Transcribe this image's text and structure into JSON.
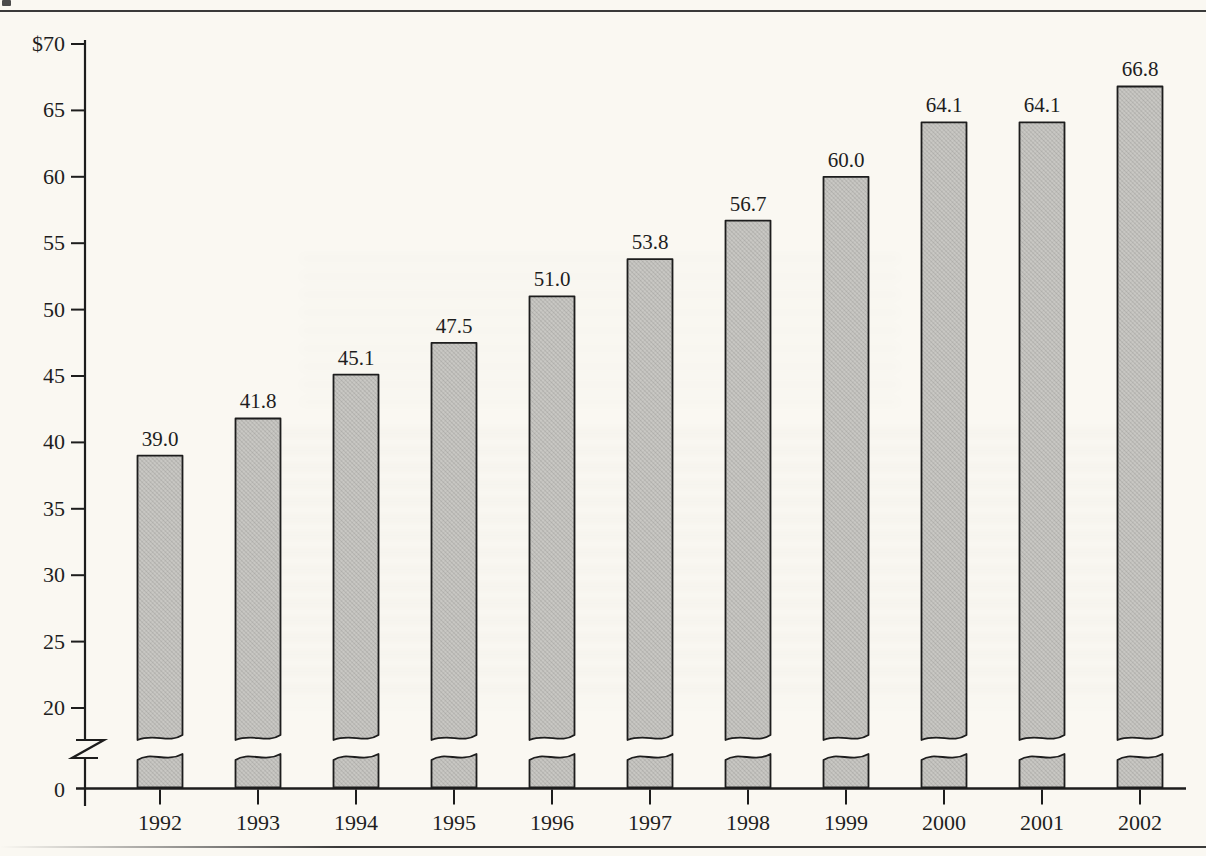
{
  "figure": {
    "kind": "scanned-book-bar-chart",
    "currency_prefix": "$"
  },
  "chart_data": {
    "type": "bar",
    "title": "",
    "xlabel": "",
    "ylabel": "",
    "categories": [
      "1992",
      "1993",
      "1994",
      "1995",
      "1996",
      "1997",
      "1998",
      "1999",
      "2000",
      "2001",
      "2002"
    ],
    "values": [
      39.0,
      41.8,
      45.1,
      47.5,
      51.0,
      53.8,
      56.7,
      60.0,
      64.1,
      64.1,
      66.8
    ],
    "value_labels": [
      "39.0",
      "41.8",
      "45.1",
      "47.5",
      "51.0",
      "53.8",
      "56.7",
      "60.0",
      "64.1",
      "64.1",
      "66.8"
    ],
    "y_axis": {
      "tick_labels": [
        "$70",
        "65",
        "60",
        "55",
        "50",
        "45",
        "40",
        "35",
        "30",
        "25",
        "20"
      ],
      "tick_values": [
        70,
        65,
        60,
        55,
        50,
        45,
        40,
        35,
        30,
        25,
        20
      ],
      "zero_label": "0",
      "shown_range": [
        20,
        70
      ],
      "has_axis_break": true
    },
    "grid": false,
    "legend": "none",
    "colors": {
      "bar_fill": "#c9c8c4",
      "bar_stroke": "#1d1d1d",
      "axis": "#1d1d1d",
      "text": "#1e1e1e",
      "paper": "#faf8f2",
      "rule": "#3a3a3a"
    }
  }
}
